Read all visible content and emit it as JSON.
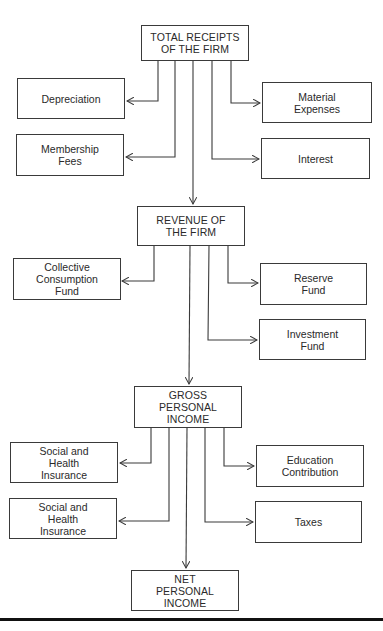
{
  "diagram": {
    "type": "flowchart",
    "colors": {
      "line": "#3a3a3a",
      "text": "#2a2a2a",
      "background": "#ffffff"
    },
    "nodes": {
      "total_receipts": {
        "label": "TOTAL RECEIPTS\nOF THE FIRM"
      },
      "depreciation": {
        "label": "Depreciation"
      },
      "membership_fees": {
        "label": "Membership\nFees"
      },
      "material_expenses": {
        "label": "Material\nExpenses"
      },
      "interest": {
        "label": "Interest"
      },
      "revenue": {
        "label": "REVENUE OF\nTHE FIRM"
      },
      "collective_consumption_fund": {
        "label": "Collective\nConsumption\nFund"
      },
      "reserve_fund": {
        "label": "Reserve\nFund"
      },
      "investment_fund": {
        "label": "Investment\nFund"
      },
      "gross_personal_income": {
        "label": "GROSS\nPERSONAL\nINCOME"
      },
      "social_health_insurance_1": {
        "label": "Social and\nHealth\nInsurance"
      },
      "social_health_insurance_2": {
        "label": "Social and\nHealth\nInsurance"
      },
      "education_contribution": {
        "label": "Education\nContribution"
      },
      "taxes": {
        "label": "Taxes"
      },
      "net_personal_income": {
        "label": "NET\nPERSONAL\nINCOME"
      }
    },
    "edges": [
      {
        "from": "total_receipts",
        "to": "depreciation"
      },
      {
        "from": "total_receipts",
        "to": "membership_fees"
      },
      {
        "from": "total_receipts",
        "to": "material_expenses"
      },
      {
        "from": "total_receipts",
        "to": "interest"
      },
      {
        "from": "total_receipts",
        "to": "revenue"
      },
      {
        "from": "revenue",
        "to": "collective_consumption_fund"
      },
      {
        "from": "revenue",
        "to": "reserve_fund"
      },
      {
        "from": "revenue",
        "to": "investment_fund"
      },
      {
        "from": "revenue",
        "to": "gross_personal_income"
      },
      {
        "from": "gross_personal_income",
        "to": "social_health_insurance_1"
      },
      {
        "from": "gross_personal_income",
        "to": "social_health_insurance_2"
      },
      {
        "from": "gross_personal_income",
        "to": "education_contribution"
      },
      {
        "from": "gross_personal_income",
        "to": "taxes"
      },
      {
        "from": "gross_personal_income",
        "to": "net_personal_income"
      }
    ]
  }
}
